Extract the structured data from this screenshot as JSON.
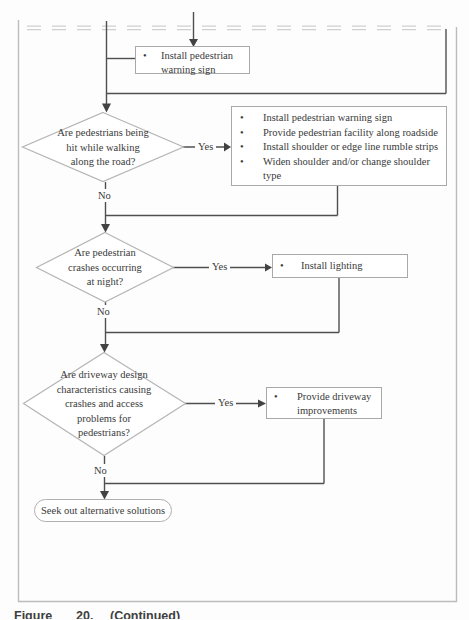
{
  "glyphs": {
    "bullet": "•"
  },
  "caption": {
    "label": "Figure",
    "number": "20.",
    "text": "(Continued)"
  },
  "flowchart": {
    "entry_action": "Install pedestrian warning sign",
    "decision1": {
      "line1": "Are pedestrians being",
      "line2": "hit while walking",
      "line3": "along the road?",
      "yes": "Yes",
      "no": "No",
      "action1": "Install pedestrian warning sign",
      "action2": "Provide pedestrian facility along roadside",
      "action3": "Install shoulder or edge line rumble strips",
      "action4": "Widen shoulder and/or change shoulder type"
    },
    "decision2": {
      "line1": "Are pedestrian",
      "line2": "crashes occurring",
      "line3": "at night?",
      "yes": "Yes",
      "no": "No",
      "action1": "Install lighting"
    },
    "decision3": {
      "line1": "Are driveway design",
      "line2": "characteristics causing",
      "line3": "crashes and access",
      "line4": "problems for",
      "line5": "pedestrians?",
      "yes": "Yes",
      "no": "No",
      "action1": "Provide driveway improvements"
    },
    "terminal": "Seek out alternative solutions"
  }
}
